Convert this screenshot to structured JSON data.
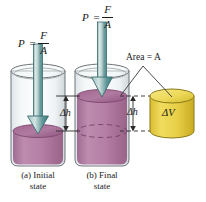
{
  "figure": {
    "background_color": "#ffffff"
  },
  "labels": {
    "pressure_initial": {
      "lhs": "P",
      "equals": "=",
      "numerator": "F",
      "denominator": "A",
      "full": "P = F/A"
    },
    "pressure_final": {
      "lhs": "P",
      "equals": "=",
      "numerator": "F",
      "denominator": "A",
      "full": "P = F/A"
    },
    "delta_h_left": "Δh",
    "delta_h_right": "Δh",
    "area": "Area = A",
    "area_text": "Area =",
    "area_symbol": "A",
    "delta_v": "ΔV"
  },
  "captions": {
    "initial": {
      "line1": "(a) Initial",
      "line2": "state"
    },
    "final": {
      "line1": "(b) Final",
      "line2": "state"
    }
  },
  "colors": {
    "liquid_purple": "#b07ba0",
    "liquid_purple_top": "#9c5f8c",
    "liquid_purple_dark": "#8f5480",
    "glass": "#e8eced",
    "glass_outline": "#6f7478",
    "arrow_teal_light": "#cfe0e0",
    "arrow_teal_dark": "#4e8e8e",
    "arrow_outline": "#3c6d70",
    "cylinder_yellow": "#e8d048",
    "cylinder_yellow_top": "#f2e06a",
    "cylinder_yellow_outline": "#8a7a18",
    "leader_line": "#3a3a3a",
    "text": "#1a1a1a"
  },
  "geometry": {
    "beaker_initial": {
      "cx": 38,
      "top_y": 71,
      "bottom_y": 166,
      "rx": 27,
      "ry": 7,
      "liquid_top_y": 131
    },
    "beaker_final": {
      "cx": 102,
      "top_y": 71,
      "bottom_y": 166,
      "rx": 27,
      "ry": 7,
      "liquid_top_y": 96,
      "dashed_level_y": 131
    },
    "cylinder_delta_v": {
      "cx": 172,
      "top_y": 96,
      "bottom_y": 131,
      "rx": 22,
      "ry": 7
    }
  }
}
